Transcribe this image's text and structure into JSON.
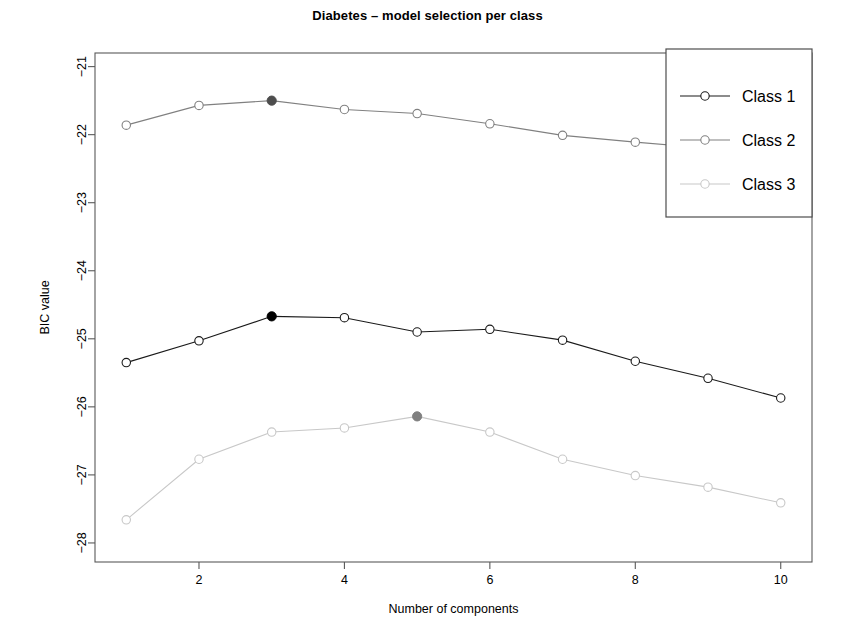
{
  "chart_data": {
    "type": "line",
    "title": "Diabetes – model selection per class",
    "xlabel": "Number of components",
    "ylabel": "BIC value",
    "x": [
      1,
      2,
      3,
      4,
      5,
      6,
      7,
      8,
      9,
      10
    ],
    "xticks": [
      2,
      4,
      6,
      8,
      10
    ],
    "xtick_labels": [
      "2",
      "4",
      "6",
      "8",
      "10"
    ],
    "yticks": [
      -21,
      -22,
      -23,
      -24,
      -25,
      -26,
      -27,
      -28
    ],
    "ytick_labels": [
      "−21",
      "−22",
      "−23",
      "−24",
      "−25",
      "−26",
      "−27",
      "−28"
    ],
    "xlim": [
      0.57,
      10.43
    ],
    "ylim": [
      -28.28,
      -20.8
    ],
    "grid": false,
    "legend_position": "top-right",
    "series": [
      {
        "name": "Class 1",
        "color": "#1a1a1a",
        "values": [
          -25.35,
          -25.03,
          -24.67,
          -24.69,
          -24.9,
          -24.86,
          -25.02,
          -25.33,
          -25.58,
          -25.87
        ],
        "selected_index": 2,
        "selected_x": 3,
        "selected_value": -24.67,
        "selected_marker_color": "#000000"
      },
      {
        "name": "Class 2",
        "color": "#808080",
        "values": [
          -21.86,
          -21.57,
          -21.5,
          -21.63,
          -21.69,
          -21.84,
          -22.01,
          -22.11,
          -22.2,
          -22.28
        ],
        "selected_index": 2,
        "selected_x": 3,
        "selected_value": -21.5,
        "selected_marker_color": "#4d4d4d"
      },
      {
        "name": "Class 3",
        "color": "#c8c8c8",
        "values": [
          -27.66,
          -26.77,
          -26.37,
          -26.31,
          -26.14,
          -26.37,
          -26.77,
          -27.01,
          -27.18,
          -27.41
        ],
        "selected_index": 4,
        "selected_x": 5,
        "selected_value": -26.14,
        "selected_marker_color": "#808080"
      }
    ]
  },
  "legend": {
    "entries": [
      {
        "label": "Class 1"
      },
      {
        "label": "Class 2"
      },
      {
        "label": "Class 3"
      }
    ]
  },
  "axes": {
    "x_title": "Number of components",
    "y_title": "BIC value"
  }
}
